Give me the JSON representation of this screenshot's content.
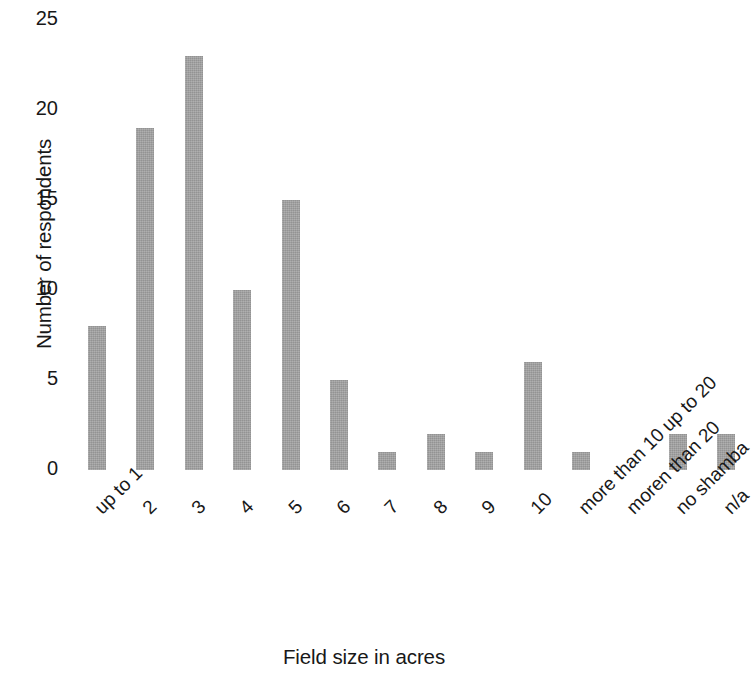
{
  "chart_data": {
    "type": "bar",
    "title": "",
    "xlabel": "Field size in acres",
    "ylabel": "Number of respondents",
    "categories": [
      "up to 1",
      "2",
      "3",
      "4",
      "5",
      "6",
      "7",
      "8",
      "9",
      "10",
      "more than 10 up to 20",
      "moren than 20",
      "no shamba",
      "n/a"
    ],
    "values": [
      8,
      19,
      23,
      10,
      15,
      5,
      1,
      2,
      1,
      6,
      1,
      0,
      2,
      2
    ],
    "ylim": [
      0,
      25
    ],
    "yticks": [
      0,
      5,
      10,
      15,
      20,
      25
    ],
    "ytick_labels": [
      "0",
      "5",
      "10",
      "15",
      "20",
      "25"
    ],
    "grid": false,
    "legend": null,
    "bar_color": "#9d9d9d",
    "text_color": "#181818",
    "background_color": "#ffffff",
    "xtick_rotation_deg": -45
  }
}
